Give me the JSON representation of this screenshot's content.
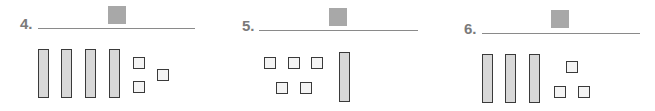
{
  "problems": [
    {
      "label": "4.",
      "tens": 4,
      "ones": 3,
      "answer_box_color": "#a8a8a8"
    },
    {
      "label": "5.",
      "tens": 1,
      "ones": 5,
      "answer_box_color": "#a8a8a8"
    },
    {
      "label": "6.",
      "tens": 3,
      "ones": 3,
      "answer_box_color": "#a8a8a8"
    }
  ],
  "colors": {
    "rod_fill": "#d8d8d8",
    "unit_fill": "#f4f4f4",
    "outline": "#3a3a3a",
    "label": "#7a7a7a",
    "line": "#8a8a8a"
  }
}
